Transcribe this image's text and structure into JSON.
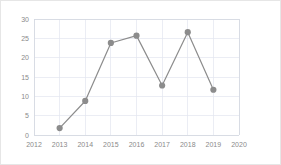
{
  "chart_data": {
    "type": "line",
    "title": "",
    "subtitle": "",
    "xlabel": "",
    "ylabel": "",
    "x": [
      2013,
      2014,
      2015,
      2016,
      2017,
      2018,
      2019
    ],
    "values": [
      1.8,
      8.8,
      23.8,
      25.7,
      12.8,
      26.6,
      11.7
    ],
    "series": [
      {
        "name": "Series 1",
        "x": [
          2013,
          2014,
          2015,
          2016,
          2017,
          2018,
          2019
        ],
        "values": [
          1.8,
          8.8,
          23.8,
          25.7,
          12.8,
          26.6,
          11.7
        ],
        "color": "#8c8c8c",
        "marker": "circle"
      }
    ],
    "xlim": [
      2012,
      2020
    ],
    "ylim": [
      0,
      30
    ],
    "x_ticks": [
      2012,
      2013,
      2014,
      2015,
      2016,
      2017,
      2018,
      2019,
      2020
    ],
    "x_tick_labels": [
      "2012",
      "2013",
      "2014",
      "2015",
      "2016",
      "2017",
      "2018",
      "2019",
      "2020"
    ],
    "y_ticks": [
      0,
      5,
      10,
      15,
      20,
      25,
      30
    ],
    "y_tick_labels": [
      "0",
      "5",
      "10",
      "15",
      "20",
      "25",
      "30"
    ],
    "grid": true,
    "grid_axis": "both",
    "legend": false,
    "legend_position": "none",
    "annotations": [],
    "colors": {
      "line": "#8c8c8c",
      "marker": "#8c8c8c",
      "grid": "#e2e6ef",
      "axis": "#d3d7e0",
      "tick_text": "#8a8a8a",
      "plot_background": "#ffffff",
      "figure_border": "#e6e6e6"
    }
  }
}
